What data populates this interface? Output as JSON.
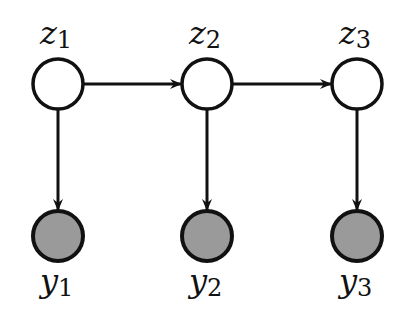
{
  "diagram": {
    "type": "hidden-markov-model",
    "colors": {
      "stroke": "#111111",
      "latent_fill": "#ffffff",
      "observed_fill": "#9a9a9a"
    },
    "latent_nodes": [
      {
        "id": "z1",
        "var": "z",
        "sub": "1",
        "cx": 58,
        "cy": 84
      },
      {
        "id": "z2",
        "var": "z",
        "sub": "2",
        "cx": 207,
        "cy": 84
      },
      {
        "id": "z3",
        "var": "z",
        "sub": "3",
        "cx": 357,
        "cy": 84
      }
    ],
    "observed_nodes": [
      {
        "id": "y1",
        "var": "y",
        "sub": "1",
        "cx": 58,
        "cy": 236
      },
      {
        "id": "y2",
        "var": "y",
        "sub": "2",
        "cx": 207,
        "cy": 236
      },
      {
        "id": "y3",
        "var": "y",
        "sub": "3",
        "cx": 357,
        "cy": 236
      }
    ],
    "edges": [
      {
        "from": "z1",
        "to": "z2"
      },
      {
        "from": "z2",
        "to": "z3"
      },
      {
        "from": "z1",
        "to": "y1"
      },
      {
        "from": "z2",
        "to": "y2"
      },
      {
        "from": "z3",
        "to": "y3"
      }
    ]
  }
}
